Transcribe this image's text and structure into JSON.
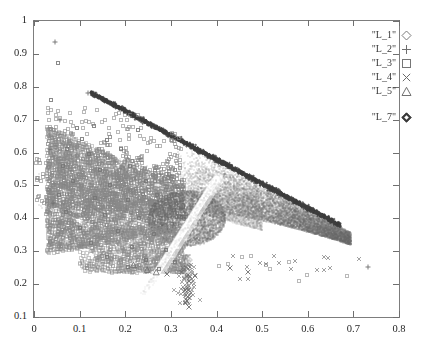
{
  "chart_data": {
    "type": "scatter",
    "title": "",
    "xlabel": "",
    "ylabel": "",
    "xlim": [
      0,
      0.8
    ],
    "ylim": [
      0.1,
      1
    ],
    "xticks": [
      "0",
      "0.1",
      "0.2",
      "0.3",
      "0.4",
      "0.5",
      "0.6",
      "0.7",
      "0.8"
    ],
    "xtick_values": [
      0,
      0.1,
      0.2,
      0.3,
      0.4,
      0.5,
      0.6,
      0.7,
      0.8
    ],
    "yticks": [
      "0.1",
      "0.2",
      "0.3",
      "0.4",
      "0.5",
      "0.6",
      "0.7",
      "0.8",
      "0.9",
      "1"
    ],
    "ytick_values": [
      0.1,
      0.2,
      0.3,
      0.4,
      0.5,
      0.6,
      0.7,
      0.8,
      0.9,
      1
    ],
    "grid": false,
    "legend_position": "top-right",
    "marker_color": "#6b6b6b",
    "frame_color": "#7d7d7d",
    "series": [
      {
        "name": "\"L_1\"",
        "marker": "diamond-open",
        "color": "#7a7a7a",
        "n_points": 0,
        "values": []
      },
      {
        "name": "\"L_2\"",
        "marker": "plus",
        "color": "#6f6f6f",
        "n_points": 6,
        "values": [
          [
            0.047,
            0.935
          ],
          [
            0.034,
            0.611
          ],
          [
            0.731,
            0.253
          ],
          [
            0.118,
            0.781
          ],
          [
            0.058,
            0.7
          ],
          [
            0.041,
            0.447
          ]
        ]
      },
      {
        "name": "\"L_3\"",
        "marker": "square-open",
        "color": "#767676",
        "n_points": 2200,
        "values": [
          [
            0.052,
            0.872
          ],
          [
            0.038,
            0.76
          ],
          [
            0.094,
            0.675
          ],
          [
            0.131,
            0.681
          ],
          [
            0.106,
            0.64
          ],
          [
            0.161,
            0.637
          ],
          [
            0.228,
            0.668
          ],
          [
            0.073,
            0.61
          ],
          [
            0.12,
            0.596
          ],
          [
            0.19,
            0.612
          ],
          [
            0.063,
            0.56
          ],
          [
            0.145,
            0.548
          ],
          [
            0.21,
            0.558
          ],
          [
            0.086,
            0.512
          ],
          [
            0.167,
            0.5
          ],
          [
            0.245,
            0.515
          ],
          [
            0.055,
            0.47
          ],
          [
            0.133,
            0.462
          ],
          [
            0.205,
            0.455
          ],
          [
            0.27,
            0.47
          ],
          [
            0.07,
            0.42
          ],
          [
            0.155,
            0.41
          ],
          [
            0.23,
            0.4
          ],
          [
            0.1,
            0.372
          ],
          [
            0.185,
            0.36
          ],
          [
            0.262,
            0.352
          ],
          [
            0.125,
            0.325
          ],
          [
            0.215,
            0.312
          ],
          [
            0.29,
            0.305
          ],
          [
            0.16,
            0.282
          ],
          [
            0.245,
            0.272
          ],
          [
            0.31,
            0.268
          ],
          [
            0.205,
            0.252
          ],
          [
            0.275,
            0.245
          ]
        ]
      },
      {
        "name": "\"L_4\"",
        "marker": "cross",
        "color": "#6a6a6a",
        "n_points": 40,
        "values": [
          [
            0.292,
            0.232
          ],
          [
            0.33,
            0.182
          ],
          [
            0.336,
            0.148
          ],
          [
            0.34,
            0.131
          ],
          [
            0.352,
            0.225
          ],
          [
            0.43,
            0.248
          ],
          [
            0.47,
            0.236
          ]
        ]
      },
      {
        "name": "\"L_5\"",
        "marker": "triangle-open",
        "color": "#717171",
        "n_points": 25,
        "values": [
          [
            0.218,
            0.258
          ],
          [
            0.248,
            0.243
          ],
          [
            0.268,
            0.236
          ]
        ]
      },
      {
        "name": "\"L_7\"",
        "marker": "diamond-filled",
        "color": "#3a3a3a",
        "n_points": 900,
        "values": [
          [
            0.125,
            0.783
          ],
          [
            0.155,
            0.76
          ],
          [
            0.185,
            0.737
          ],
          [
            0.215,
            0.714
          ],
          [
            0.245,
            0.692
          ],
          [
            0.275,
            0.67
          ],
          [
            0.305,
            0.648
          ],
          [
            0.335,
            0.626
          ],
          [
            0.365,
            0.604
          ],
          [
            0.395,
            0.582
          ],
          [
            0.425,
            0.56
          ],
          [
            0.455,
            0.538
          ],
          [
            0.485,
            0.516
          ],
          [
            0.515,
            0.494
          ],
          [
            0.545,
            0.472
          ],
          [
            0.575,
            0.45
          ],
          [
            0.605,
            0.428
          ],
          [
            0.635,
            0.406
          ],
          [
            0.665,
            0.384
          ]
        ]
      }
    ],
    "structure_notes": {
      "dense_wedge_apex": [
        0.335,
        0.4
      ],
      "upper_ridge_line_from": [
        0.12,
        0.785
      ],
      "upper_ridge_line_to": [
        0.67,
        0.38
      ],
      "light_band_from": [
        0.24,
        0.17
      ],
      "light_band_to": [
        0.4,
        0.52
      ],
      "fan_origin": [
        0.335,
        0.4
      ],
      "bottom_spike_x": 0.335,
      "bottom_spike_min_y": 0.13
    }
  },
  "legend": {
    "entries": [
      {
        "label": "\"L_1\"",
        "marker": "diamond-open"
      },
      {
        "label": "\"L_2\"",
        "marker": "plus"
      },
      {
        "label": "\"L_3\"",
        "marker": "square-open"
      },
      {
        "label": "\"L_4\"",
        "marker": "cross"
      },
      {
        "label": "\"L_5\"",
        "marker": "triangle-open"
      },
      {
        "label": "\"L_7\"",
        "marker": "diamond-filled"
      }
    ]
  }
}
